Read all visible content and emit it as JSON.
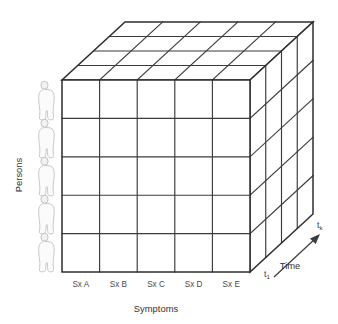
{
  "figure": {
    "type": "3d-data-cube-diagram",
    "background_color": "#ffffff",
    "line_color": "#3b3b3b",
    "text_color": "#4a4a4a"
  },
  "axes": {
    "persons": {
      "label": "Persons",
      "orientation": "vertical",
      "count": 5,
      "icon": "person-silhouette-icon"
    },
    "symptoms": {
      "label": "Symptoms",
      "orientation": "horizontal",
      "count": 5,
      "ticks": [
        "Sx A",
        "Sx B",
        "Sx C",
        "Sx D",
        "Sx E"
      ]
    },
    "time": {
      "label": "Time",
      "orientation": "depth",
      "count": 4,
      "start_tick": "t",
      "start_tick_sub": "1",
      "end_tick": "t",
      "end_tick_sub": "k"
    }
  },
  "cube": {
    "columns": 5,
    "rows": 5,
    "slices": 4,
    "front_face_cells": 25,
    "top_face_cells": 20,
    "side_face_cells": 20
  }
}
